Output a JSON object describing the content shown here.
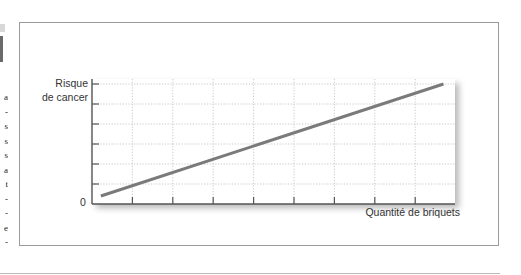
{
  "chart_data": {
    "type": "line",
    "title": "",
    "xlabel": "Quantité de briquets",
    "ylabel": "Risque de cancer",
    "ylabel_lines": [
      "Risque",
      "de cancer"
    ],
    "y_origin_label": "0",
    "x_ticks": 8,
    "y_ticks": 6,
    "grid": true,
    "grid_style": "dotted",
    "xlim": [
      0,
      9
    ],
    "ylim": [
      0,
      6
    ],
    "series": [
      {
        "name": "Risque de cancer",
        "color": "#7a7a7a",
        "x": [
          0.22,
          8.7
        ],
        "y": [
          0.4,
          6.0
        ]
      }
    ],
    "legend": null
  },
  "colors": {
    "line": "#7a7a7a",
    "axis": "#555555",
    "grid": "#bdbdbd",
    "frame": "#9a9a9a"
  },
  "margin_fragment": {
    "chars": [
      "a",
      "-",
      "s",
      "s",
      "s",
      "a",
      "t",
      "-",
      "-",
      "e",
      "-"
    ]
  }
}
